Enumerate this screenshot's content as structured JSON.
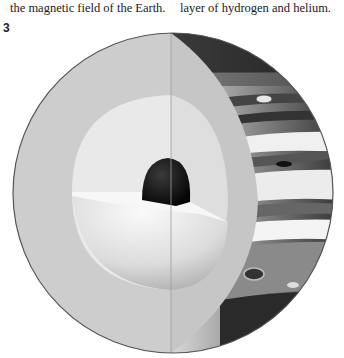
{
  "text_fragments": {
    "left_column_tail": "the magnetic field of the Earth.",
    "right_column_tail": "layer of hydrogen and helium."
  },
  "figure": {
    "number": "3",
    "layers": [
      {
        "name": "core",
        "color": "#141414"
      },
      {
        "name": "inner-layer",
        "color": "#f2f2f2"
      },
      {
        "name": "outer-layer",
        "color": "#cfcfcf"
      },
      {
        "name": "banded-atmosphere-surface",
        "color": "#6e6e6e"
      }
    ]
  }
}
